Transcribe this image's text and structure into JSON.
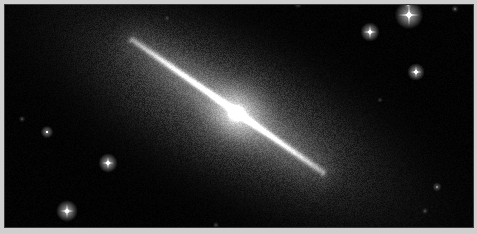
{
  "figure": {
    "type": "astronomical-image",
    "width": 477,
    "height": 234,
    "caption": "",
    "border": {
      "outer_color": "#cfcfcf",
      "outer_thickness_px": 4,
      "inner_line_color": "#3a3a3a",
      "inner_line_px": 1
    },
    "sky": {
      "background_color": "#000000",
      "image_left": 5,
      "image_top": 5,
      "image_width": 468,
      "image_height": 222
    }
  },
  "galaxy": {
    "name": "",
    "morphology": "edge-on spiral",
    "position_angle_deg": 29,
    "core": {
      "x": 236,
      "y": 113,
      "radius_px": 7,
      "peak_color": "#ffffff",
      "brightness": 1.0
    },
    "disk": {
      "start": {
        "x": 132,
        "y": 40
      },
      "end": {
        "x": 322,
        "y": 172
      },
      "half_length_px": 118,
      "thickness_px": 2.6,
      "color": "#eeeeee",
      "brightness": 0.82
    },
    "halo": {
      "center_x": 230,
      "center_y": 110,
      "semi_major_px": 168,
      "semi_minor_px": 62,
      "angle_deg": 29,
      "color": "#9a9a9a",
      "brightness": 0.3,
      "grain": "speckled"
    },
    "dust_lane": {
      "present": true,
      "offset_px": 2,
      "opacity": 0.22
    }
  },
  "stars": [
    {
      "id": "star-1",
      "x": 409,
      "y": 15,
      "radius": 3.4,
      "brightness": 1.0,
      "spikes": true,
      "spike_len": 11
    },
    {
      "id": "star-2",
      "x": 370,
      "y": 32,
      "radius": 2.3,
      "brightness": 0.92,
      "spikes": true,
      "spike_len": 7
    },
    {
      "id": "star-3",
      "x": 416,
      "y": 72,
      "radius": 2.1,
      "brightness": 0.9,
      "spikes": true,
      "spike_len": 6
    },
    {
      "id": "star-4",
      "x": 408,
      "y": 5,
      "radius": 1.0,
      "brightness": 0.42,
      "spikes": false,
      "spike_len": 0
    },
    {
      "id": "star-5",
      "x": 455,
      "y": 9,
      "radius": 0.9,
      "brightness": 0.35,
      "spikes": false,
      "spike_len": 0
    },
    {
      "id": "star-6",
      "x": 47,
      "y": 132,
      "radius": 1.5,
      "brightness": 0.7,
      "spikes": false,
      "spike_len": 0
    },
    {
      "id": "star-7",
      "x": 108,
      "y": 163,
      "radius": 2.3,
      "brightness": 0.93,
      "spikes": true,
      "spike_len": 6
    },
    {
      "id": "star-8",
      "x": 67,
      "y": 211,
      "radius": 2.6,
      "brightness": 0.96,
      "spikes": true,
      "spike_len": 7
    },
    {
      "id": "star-9",
      "x": 22,
      "y": 119,
      "radius": 0.8,
      "brightness": 0.3,
      "spikes": false,
      "spike_len": 0
    },
    {
      "id": "star-10",
      "x": 298,
      "y": 4,
      "radius": 1.0,
      "brightness": 0.38,
      "spikes": false,
      "spike_len": 0
    },
    {
      "id": "star-11",
      "x": 437,
      "y": 187,
      "radius": 1.1,
      "brightness": 0.45,
      "spikes": false,
      "spike_len": 0
    },
    {
      "id": "star-12",
      "x": 425,
      "y": 211,
      "radius": 0.8,
      "brightness": 0.28,
      "spikes": false,
      "spike_len": 0
    },
    {
      "id": "star-13",
      "x": 216,
      "y": 225,
      "radius": 0.8,
      "brightness": 0.26,
      "spikes": false,
      "spike_len": 0
    },
    {
      "id": "star-14",
      "x": 380,
      "y": 100,
      "radius": 0.7,
      "brightness": 0.22,
      "spikes": false,
      "spike_len": 0
    },
    {
      "id": "star-15",
      "x": 167,
      "y": 18,
      "radius": 0.7,
      "brightness": 0.2,
      "spikes": false,
      "spike_len": 0
    }
  ],
  "noise": {
    "sky_grain_amplitude": 7,
    "halo_grain_amplitude": 34,
    "seed": 20240517
  }
}
